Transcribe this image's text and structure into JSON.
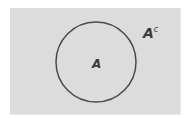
{
  "diagram": {
    "type": "venn",
    "universe": {
      "label_set": "A",
      "complement_label": "A",
      "complement_superscript": "c"
    },
    "circle": {
      "label": "A"
    },
    "colors": {
      "universe_fill": "#dcdcdc",
      "circle_stroke": "#4a4a4a",
      "label": "#3a3a3a"
    }
  }
}
